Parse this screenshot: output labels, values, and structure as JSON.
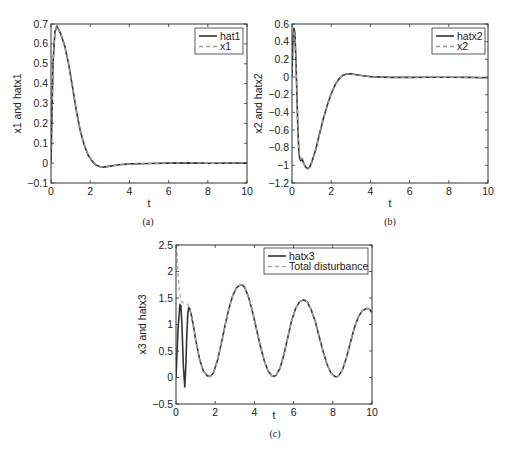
{
  "chart_data": [
    {
      "id": "a",
      "type": "line",
      "caption": "(a)",
      "xlabel": "t",
      "ylabel": "x1 and hatx1",
      "xlim": [
        0,
        10
      ],
      "ylim": [
        -0.1,
        0.7
      ],
      "xticks": [
        0,
        2,
        4,
        6,
        8,
        10
      ],
      "yticks": [
        -0.1,
        0,
        0.1,
        0.2,
        0.3,
        0.4,
        0.5,
        0.6,
        0.7
      ],
      "ytick_labels": [
        "-0.1",
        "0",
        "0.1",
        "0.2",
        "0.3",
        "0.4",
        "0.5",
        "0.6",
        "0.7"
      ],
      "grid": false,
      "legend_position": "upper right",
      "series": [
        {
          "name": "hat1",
          "style": "solid",
          "color": "#333333",
          "x": [
            0,
            0.05,
            0.1,
            0.2,
            0.3,
            0.5,
            0.7,
            0.9,
            1.1,
            1.3,
            1.5,
            1.7,
            1.9,
            2.1,
            2.3,
            2.5,
            2.7,
            3.0,
            3.5,
            4,
            5,
            6,
            7,
            8,
            9,
            10
          ],
          "y": [
            0,
            0.25,
            0.5,
            0.66,
            0.69,
            0.65,
            0.59,
            0.5,
            0.38,
            0.26,
            0.16,
            0.09,
            0.04,
            0.01,
            -0.01,
            -0.018,
            -0.02,
            -0.015,
            -0.008,
            -0.004,
            -0.002,
            0.0,
            0.001,
            -0.001,
            0.0,
            0.0
          ]
        },
        {
          "name": "x1",
          "style": "dashed",
          "color": "#999999",
          "x": [
            0,
            0.05,
            0.1,
            0.2,
            0.3,
            0.5,
            0.7,
            0.9,
            1.1,
            1.3,
            1.5,
            1.7,
            1.9,
            2.1,
            2.3,
            2.5,
            2.7,
            3.0,
            3.5,
            4,
            5,
            6,
            7,
            8,
            9,
            10
          ],
          "y": [
            0,
            0.25,
            0.5,
            0.66,
            0.69,
            0.65,
            0.59,
            0.5,
            0.38,
            0.26,
            0.16,
            0.09,
            0.04,
            0.01,
            -0.01,
            -0.018,
            -0.02,
            -0.015,
            -0.008,
            -0.004,
            -0.002,
            0.0,
            0.001,
            -0.001,
            0.0,
            0.0
          ]
        }
      ]
    },
    {
      "id": "b",
      "type": "line",
      "caption": "(b)",
      "xlabel": "t",
      "ylabel": "x2 and hatx2",
      "xlim": [
        0,
        10
      ],
      "ylim": [
        -1.2,
        0.6
      ],
      "xticks": [
        0,
        2,
        4,
        6,
        8,
        10
      ],
      "yticks": [
        -1.2,
        -1,
        -0.8,
        -0.6,
        -0.4,
        -0.2,
        0,
        0.2,
        0.4,
        0.6
      ],
      "ytick_labels": [
        "-1.2",
        "-1",
        "-0.8",
        "-0.6",
        "-0.4",
        "-0.2",
        "0",
        "0.2",
        "0.4",
        "0.6"
      ],
      "grid": false,
      "legend_position": "upper right",
      "series": [
        {
          "name": "hatx2",
          "style": "solid",
          "color": "#333333",
          "x": [
            0,
            0.05,
            0.1,
            0.15,
            0.2,
            0.25,
            0.3,
            0.35,
            0.4,
            0.45,
            0.5,
            0.55,
            0.6,
            0.7,
            0.8,
            0.9,
            1.0,
            1.2,
            1.4,
            1.6,
            1.8,
            2.0,
            2.2,
            2.4,
            2.6,
            2.8,
            3.0,
            3.3,
            3.6,
            4,
            5,
            6,
            7,
            8,
            9,
            10
          ],
          "y": [
            0,
            0.45,
            0.55,
            0.5,
            0.2,
            -0.2,
            -0.6,
            -0.85,
            -0.93,
            -0.95,
            -0.92,
            -0.95,
            -0.98,
            -1.02,
            -1.04,
            -1.02,
            -0.97,
            -0.83,
            -0.65,
            -0.47,
            -0.32,
            -0.19,
            -0.09,
            -0.02,
            0.02,
            0.035,
            0.035,
            0.025,
            0.015,
            0.005,
            -0.005,
            -0.005,
            -0.002,
            -0.003,
            -0.005,
            -0.008
          ]
        },
        {
          "name": "x2",
          "style": "dashed",
          "color": "#999999",
          "x": [
            0,
            0.05,
            0.1,
            0.15,
            0.2,
            0.25,
            0.3,
            0.35,
            0.4,
            0.45,
            0.5,
            0.55,
            0.6,
            0.7,
            0.8,
            0.9,
            1.0,
            1.2,
            1.4,
            1.6,
            1.8,
            2.0,
            2.2,
            2.4,
            2.6,
            2.8,
            3.0,
            3.3,
            3.6,
            4,
            5,
            6,
            7,
            8,
            9,
            10
          ],
          "y": [
            0,
            0.42,
            0.53,
            0.48,
            0.2,
            -0.2,
            -0.6,
            -0.85,
            -0.92,
            -0.93,
            -0.92,
            -0.95,
            -0.98,
            -1.02,
            -1.04,
            -1.02,
            -0.97,
            -0.83,
            -0.65,
            -0.47,
            -0.32,
            -0.19,
            -0.09,
            -0.02,
            0.02,
            0.035,
            0.035,
            0.025,
            0.015,
            0.005,
            -0.005,
            -0.005,
            -0.002,
            -0.003,
            -0.005,
            -0.008
          ]
        }
      ]
    },
    {
      "id": "c",
      "type": "line",
      "caption": "(c)",
      "xlabel": "t",
      "ylabel": "x3 and hatx3",
      "xlim": [
        0,
        10
      ],
      "ylim": [
        -0.5,
        2.5
      ],
      "xticks": [
        0,
        2,
        4,
        6,
        8,
        10
      ],
      "yticks": [
        -0.5,
        0,
        0.5,
        1,
        1.5,
        2,
        2.5
      ],
      "ytick_labels": [
        "-0.5",
        "0",
        "0.5",
        "1",
        "1.5",
        "2",
        "2.5"
      ],
      "grid": false,
      "legend_position": "upper right",
      "series": [
        {
          "name": "hatx3",
          "style": "solid",
          "color": "#333333",
          "x": [
            0,
            0.1,
            0.2,
            0.25,
            0.3,
            0.38,
            0.45,
            0.5,
            0.55,
            0.6,
            0.65,
            0.7,
            0.8,
            0.9,
            1.0,
            1.2,
            1.4,
            1.6,
            1.75,
            1.9,
            2.1,
            2.3,
            2.5,
            2.7,
            2.9,
            3.1,
            3.3,
            3.4,
            3.5,
            3.7,
            3.9,
            4.1,
            4.3,
            4.5,
            4.7,
            4.9,
            5.0,
            5.1,
            5.3,
            5.5,
            5.7,
            5.9,
            6.1,
            6.3,
            6.5,
            6.6,
            6.7,
            6.9,
            7.1,
            7.3,
            7.5,
            7.7,
            7.9,
            8.1,
            8.2,
            8.3,
            8.5,
            8.7,
            8.9,
            9.1,
            9.3,
            9.5,
            9.7,
            9.8,
            9.9,
            10
          ],
          "y": [
            0,
            0.9,
            1.38,
            1.35,
            1.0,
            0.2,
            -0.18,
            0.2,
            0.8,
            1.2,
            1.32,
            1.3,
            1.15,
            0.95,
            0.72,
            0.35,
            0.12,
            0.03,
            0.02,
            0.08,
            0.3,
            0.62,
            0.98,
            1.3,
            1.55,
            1.7,
            1.75,
            1.74,
            1.7,
            1.52,
            1.25,
            0.92,
            0.6,
            0.32,
            0.12,
            0.03,
            0.02,
            0.04,
            0.17,
            0.42,
            0.75,
            1.07,
            1.3,
            1.43,
            1.46,
            1.45,
            1.42,
            1.28,
            1.06,
            0.78,
            0.5,
            0.26,
            0.09,
            0.02,
            0.01,
            0.03,
            0.15,
            0.38,
            0.66,
            0.94,
            1.14,
            1.26,
            1.3,
            1.3,
            1.28,
            1.22
          ]
        },
        {
          "name": "Total disturbance",
          "style": "dashed",
          "color": "#aaaaaa",
          "x": [
            0,
            0.05,
            0.1,
            0.15,
            0.2,
            0.25,
            0.3,
            0.35,
            0.4,
            0.5,
            0.6,
            0.65,
            0.7,
            0.8,
            0.9,
            1.0,
            1.2,
            1.4,
            1.6,
            1.75,
            1.9,
            2.1,
            2.3,
            2.5,
            2.7,
            2.9,
            3.1,
            3.3,
            3.4,
            3.5,
            3.7,
            3.9,
            4.1,
            4.3,
            4.5,
            4.7,
            4.9,
            5.0,
            5.1,
            5.3,
            5.5,
            5.7,
            5.9,
            6.1,
            6.3,
            6.5,
            6.6,
            6.7,
            6.9,
            7.1,
            7.3,
            7.5,
            7.7,
            7.9,
            8.1,
            8.2,
            8.3,
            8.5,
            8.7,
            8.9,
            9.1,
            9.3,
            9.5,
            9.7,
            9.8,
            9.9,
            10
          ],
          "y": [
            2.5,
            2.3,
            2.0,
            1.75,
            1.55,
            1.45,
            1.42,
            1.42,
            1.41,
            1.4,
            1.38,
            1.33,
            1.3,
            1.15,
            0.95,
            0.72,
            0.35,
            0.12,
            0.03,
            0.02,
            0.08,
            0.3,
            0.62,
            0.98,
            1.3,
            1.55,
            1.7,
            1.75,
            1.74,
            1.7,
            1.52,
            1.25,
            0.92,
            0.6,
            0.32,
            0.12,
            0.03,
            0.02,
            0.04,
            0.17,
            0.42,
            0.75,
            1.07,
            1.3,
            1.43,
            1.46,
            1.45,
            1.42,
            1.28,
            1.06,
            0.78,
            0.5,
            0.26,
            0.09,
            0.02,
            0.01,
            0.03,
            0.15,
            0.38,
            0.66,
            0.94,
            1.14,
            1.26,
            1.3,
            1.3,
            1.28,
            1.22
          ]
        }
      ]
    }
  ],
  "layout": {
    "panels": [
      {
        "left": 51,
        "top": 24,
        "right": 247,
        "bottom": 183,
        "legend": {
          "x": 195,
          "y": 28,
          "w": 48,
          "h": 26
        },
        "caption_x": 148,
        "caption_y": 225,
        "xlabel_y": 207
      },
      {
        "left": 292,
        "top": 24,
        "right": 488,
        "bottom": 183,
        "legend": {
          "x": 432,
          "y": 28,
          "w": 53,
          "h": 26
        },
        "caption_x": 390,
        "caption_y": 225,
        "xlabel_y": 207
      },
      {
        "left": 176,
        "top": 245,
        "right": 372,
        "bottom": 404,
        "legend": {
          "x": 264,
          "y": 248,
          "w": 104,
          "h": 26
        },
        "caption_x": 275,
        "caption_y": 437,
        "xlabel_y": 419
      }
    ]
  }
}
